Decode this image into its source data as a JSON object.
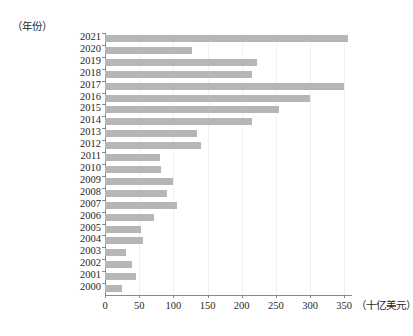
{
  "chart_data": {
    "type": "bar",
    "orientation": "horizontal",
    "title": "",
    "subtitle": "",
    "xlabel": "（十亿美元）",
    "ylabel": "（年份）",
    "xlim": [
      0,
      360
    ],
    "ylim": null,
    "grid": true,
    "legend": null,
    "legend_position": "none",
    "bar_color": "#b6b6b6",
    "axis_color": "#8a8a8a",
    "gridline_color": "#f0f0f0",
    "x_ticks": [
      0,
      50,
      100,
      150,
      200,
      250,
      300,
      350
    ],
    "x_tick_labels": [
      "0",
      "50",
      "100",
      "150",
      "200",
      "250",
      "300",
      "350"
    ],
    "categories": [
      "2021",
      "2020",
      "2019",
      "2018",
      "2017",
      "2016",
      "2015",
      "2014",
      "2013",
      "2012",
      "2011",
      "2010",
      "2009",
      "2008",
      "2007",
      "2006",
      "2005",
      "2004",
      "2003",
      "2002",
      "2001",
      "2000"
    ],
    "values": [
      355,
      127,
      222,
      215,
      350,
      300,
      255,
      215,
      135,
      140,
      80,
      82,
      100,
      90,
      105,
      72,
      52,
      55,
      30,
      40,
      45,
      25
    ],
    "bars": [
      {
        "category": "2021",
        "value": 355
      },
      {
        "category": "2020",
        "value": 127
      },
      {
        "category": "2019",
        "value": 222
      },
      {
        "category": "2018",
        "value": 215
      },
      {
        "category": "2017",
        "value": 350
      },
      {
        "category": "2016",
        "value": 300
      },
      {
        "category": "2015",
        "value": 255
      },
      {
        "category": "2014",
        "value": 215
      },
      {
        "category": "2013",
        "value": 135
      },
      {
        "category": "2012",
        "value": 140
      },
      {
        "category": "2011",
        "value": 80
      },
      {
        "category": "2010",
        "value": 82
      },
      {
        "category": "2009",
        "value": 100
      },
      {
        "category": "2008",
        "value": 90
      },
      {
        "category": "2007",
        "value": 105
      },
      {
        "category": "2006",
        "value": 72
      },
      {
        "category": "2005",
        "value": 52
      },
      {
        "category": "2004",
        "value": 55
      },
      {
        "category": "2003",
        "value": 30
      },
      {
        "category": "2002",
        "value": 40
      },
      {
        "category": "2001",
        "value": 45
      },
      {
        "category": "2000",
        "value": 25
      }
    ]
  }
}
